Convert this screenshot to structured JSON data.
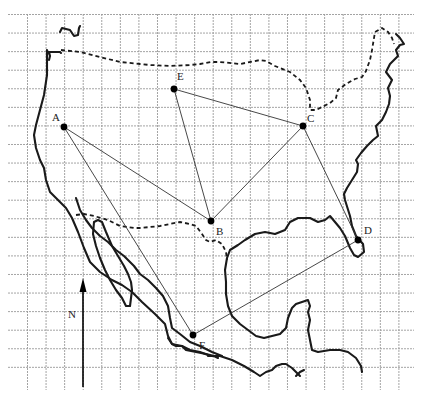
{
  "diagram": {
    "type": "map-with-points",
    "compass_label": "N",
    "points": [
      {
        "id": "A",
        "label": "A"
      },
      {
        "id": "B",
        "label": "B"
      },
      {
        "id": "C",
        "label": "C"
      },
      {
        "id": "D",
        "label": "D"
      },
      {
        "id": "E",
        "label": "E"
      },
      {
        "id": "F",
        "label": "F"
      }
    ],
    "connections": [
      [
        "A",
        "B"
      ],
      [
        "A",
        "F"
      ],
      [
        "E",
        "B"
      ],
      [
        "E",
        "C"
      ],
      [
        "C",
        "B"
      ],
      [
        "C",
        "D"
      ],
      [
        "D",
        "F"
      ]
    ],
    "colors": {
      "line": "#333333",
      "grid": "#9a9a9a",
      "point": "#000000"
    }
  }
}
